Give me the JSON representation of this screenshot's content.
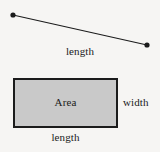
{
  "figure": {
    "background_color": "#f6f5f3",
    "stroke_color": "#1b1b1b",
    "rectangle_fill_color": "#c9c9c9",
    "text_color": "#1b1b1b"
  },
  "segment": {
    "label": "length",
    "endpoint_start": {
      "x": 13,
      "y": 15
    },
    "endpoint_end": {
      "x": 147,
      "y": 45
    },
    "endpoint_radius": 2.6,
    "stroke_width": 1.1
  },
  "rectangle": {
    "area_label": "Area",
    "width_label": "width",
    "length_label": "length",
    "x": 13,
    "y": 78,
    "width": 105,
    "height": 50,
    "stroke_width": 2
  },
  "chart_data": {
    "type": "diagram",
    "shapes": [
      {
        "kind": "line-segment",
        "label": "length",
        "label_position": "below-center",
        "points": [
          [
            13,
            15
          ],
          [
            147,
            45
          ]
        ],
        "endpoints_marked": true
      },
      {
        "kind": "rectangle",
        "labels": {
          "interior": "Area",
          "right": "width",
          "bottom": "length"
        },
        "x": 13,
        "y": 78,
        "width": 105,
        "height": 50,
        "fill": "#c9c9c9",
        "stroke": "#1b1b1b"
      }
    ]
  }
}
